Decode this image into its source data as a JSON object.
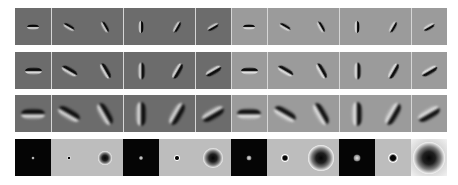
{
  "figure": {
    "rows": 4,
    "columns": 12,
    "halves": [
      {
        "name": "left",
        "background": "#6c6c6c"
      },
      {
        "name": "right",
        "background": "#9b9b9b"
      }
    ],
    "orientations_deg": [
      0,
      30,
      60,
      90,
      120,
      150,
      0,
      30,
      60,
      90,
      120,
      150
    ],
    "divider_after_columns": [
      1,
      3,
      5,
      6,
      7,
      9,
      11
    ],
    "gabor_rows": [
      {
        "row": 1,
        "scale": "small",
        "length": 12,
        "thickness": 3
      },
      {
        "row": 2,
        "scale": "medium",
        "length": 17,
        "thickness": 4
      },
      {
        "row": 3,
        "scale": "large",
        "length": 24,
        "thickness": 6
      }
    ],
    "center_surround_row": {
      "row": 4,
      "cells": [
        {
          "bg": "black",
          "type": "dot",
          "size": 3
        },
        {
          "bg": "pale",
          "type": "dark-dot",
          "size": 4
        },
        {
          "bg": "pale",
          "type": "ring",
          "size": 14
        },
        {
          "bg": "black",
          "type": "dot",
          "size": 4
        },
        {
          "bg": "pale",
          "type": "dark-dot",
          "size": 6
        },
        {
          "bg": "pale",
          "type": "ring",
          "size": 20
        },
        {
          "bg": "black",
          "type": "dot",
          "size": 5
        },
        {
          "bg": "pale",
          "type": "dark-dot",
          "size": 8
        },
        {
          "bg": "pale",
          "type": "ring",
          "size": 26
        },
        {
          "bg": "black",
          "type": "dot",
          "size": 7
        },
        {
          "bg": "pale",
          "type": "dark-dot",
          "size": 10
        },
        {
          "bg": "fade",
          "type": "ring",
          "size": 32
        }
      ]
    }
  }
}
